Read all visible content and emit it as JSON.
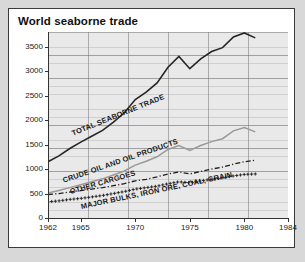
{
  "chart": {
    "title": "World seaborne trade"
  },
  "axes": {
    "y_ticks": [
      "0",
      "500",
      "1000",
      "1500",
      "2000",
      "2500",
      "3000",
      "3500"
    ],
    "x_ticks": [
      "1962",
      "1965",
      "1970",
      "1975",
      "1980",
      "1984"
    ]
  },
  "series_labels": {
    "total": "TOTAL SEABORNE TRADE",
    "crude": "CRUDE OIL AND OIL PRODUCTS",
    "other": "OTHER CARGOES",
    "bulks": "MAJOR BULKS, IRON ORE, COAL, GRAIN"
  },
  "colors": {
    "total_line": "#262626",
    "crude_line": "#9a9a9a",
    "other_line": "#1f1f1f",
    "bulks_line": "#1f1f1f",
    "plot_background": "#e9e9e9",
    "frame": "#3a3a3a",
    "page_background": "#d8d8d8"
  },
  "chart_data": {
    "type": "line",
    "title": "World seaborne trade",
    "xlabel": "",
    "ylabel": "",
    "xlim": [
      1962,
      1984
    ],
    "ylim": [
      0,
      3800
    ],
    "grid": true,
    "legend": "inline-curve-labels",
    "x": [
      1962,
      1963,
      1964,
      1965,
      1966,
      1967,
      1968,
      1969,
      1970,
      1971,
      1972,
      1973,
      1974,
      1975,
      1976,
      1977,
      1978,
      1979,
      1980,
      1981
    ],
    "series": [
      {
        "name": "TOTAL SEABORNE TRADE",
        "style": "solid",
        "color": "#262626",
        "values": [
          1150,
          1270,
          1420,
          1550,
          1670,
          1790,
          1960,
          2150,
          2420,
          2570,
          2760,
          3080,
          3300,
          3050,
          3250,
          3400,
          3480,
          3700,
          3780,
          3680
        ]
      },
      {
        "name": "CRUDE OIL AND OIL PRODUCTS",
        "style": "solid-gray",
        "color": "#9a9a9a",
        "values": [
          510,
          560,
          620,
          680,
          740,
          800,
          880,
          960,
          1080,
          1160,
          1250,
          1400,
          1480,
          1380,
          1480,
          1560,
          1620,
          1780,
          1850,
          1760
        ]
      },
      {
        "name": "OTHER CARGOES",
        "style": "dash-dot",
        "color": "#1f1f1f",
        "values": [
          480,
          500,
          530,
          560,
          590,
          620,
          660,
          700,
          760,
          790,
          840,
          900,
          940,
          900,
          950,
          1000,
          1040,
          1100,
          1150,
          1180
        ]
      },
      {
        "name": "MAJOR BULKS, IRON ORE, COAL, GRAIN",
        "style": "plus-markers",
        "color": "#1f1f1f",
        "values": [
          330,
          350,
          380,
          400,
          430,
          460,
          500,
          540,
          590,
          620,
          650,
          700,
          740,
          720,
          760,
          790,
          820,
          860,
          890,
          900
        ]
      }
    ]
  }
}
